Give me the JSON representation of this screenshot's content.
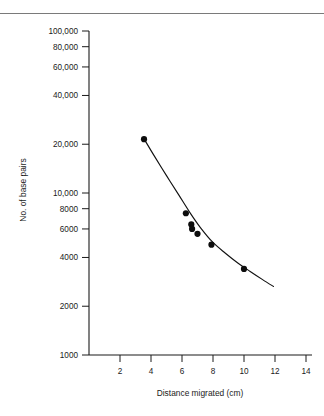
{
  "figure": {
    "name": "dna-standard-curve",
    "background_color": "#ffffff",
    "ink_color": "#1a1a1a",
    "has_top_rule": true
  },
  "chart_data": {
    "type": "scatter",
    "title": "",
    "subtitle": "",
    "xlabel": "Distance migrated (cm)",
    "ylabel": "No. of base pairs",
    "xscale": "linear",
    "yscale": "log",
    "xlim": [
      0,
      14.8
    ],
    "ylim": [
      1000,
      100000
    ],
    "grid": false,
    "legend": null,
    "xticks": [
      2,
      4,
      6,
      8,
      10,
      12,
      14
    ],
    "xtick_labels": [
      "2",
      "4",
      "6",
      "8",
      "10",
      "12",
      "14"
    ],
    "yticks": [
      1000,
      2000,
      4000,
      6000,
      8000,
      10000,
      20000,
      40000,
      60000,
      80000,
      100000
    ],
    "ytick_labels": [
      "1000",
      "2000",
      "4000",
      "6000",
      "8000",
      "10,000",
      "20,000",
      "40,000",
      "60,000",
      "80,000",
      "100,000"
    ],
    "series": [
      {
        "name": "DNA size standards",
        "marker": "filled-circle",
        "color": "#0d0d0d",
        "x": [
          3.55,
          6.25,
          6.6,
          6.65,
          7.0,
          7.9,
          10.0
        ],
        "y": [
          21500,
          7500,
          6400,
          6000,
          5600,
          4800,
          3400
        ]
      }
    ],
    "fit_curve": {
      "name": "calibration-curve",
      "color": "#111111",
      "x": [
        3.5,
        4.2,
        5.0,
        5.8,
        6.5,
        7.2,
        8.0,
        8.8,
        9.6,
        10.4,
        11.2,
        11.9
      ],
      "y": [
        22000,
        17000,
        12800,
        9700,
        7600,
        6100,
        4950,
        4250,
        3700,
        3280,
        2920,
        2650
      ]
    },
    "annotations": []
  }
}
